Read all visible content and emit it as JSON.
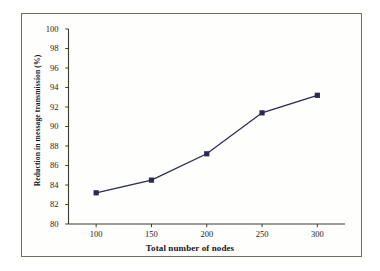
{
  "figure": {
    "background_color": "#ffffff",
    "frame_color": "#6e6e5e",
    "series_color": "#2a2a52"
  },
  "chart_data": {
    "type": "line",
    "title": "",
    "xlabel": "Total number of nodes",
    "ylabel": "Reduction in message transmission (%)",
    "x": [
      100,
      150,
      200,
      250,
      300
    ],
    "values": [
      83.2,
      84.5,
      87.2,
      91.4,
      93.2
    ],
    "series": [
      {
        "name": "Reduction in message transmission",
        "color": "#2a2a52",
        "marker": "square",
        "values": [
          83.2,
          84.5,
          87.2,
          91.4,
          93.2
        ]
      }
    ],
    "xlim": [
      75,
      325
    ],
    "ylim": [
      80,
      100
    ],
    "xticks": [
      100,
      150,
      200,
      250,
      300
    ],
    "yticks": [
      80,
      82,
      84,
      86,
      88,
      90,
      92,
      94,
      96,
      98,
      100
    ],
    "xtick_labels": [
      "100",
      "150",
      "200",
      "250",
      "300"
    ],
    "ytick_labels": [
      "80",
      "82",
      "84",
      "86",
      "88",
      "90",
      "92",
      "94",
      "96",
      "98",
      "100"
    ],
    "grid": false,
    "legend": null,
    "legend_position": "none",
    "tick_direction": "out"
  }
}
